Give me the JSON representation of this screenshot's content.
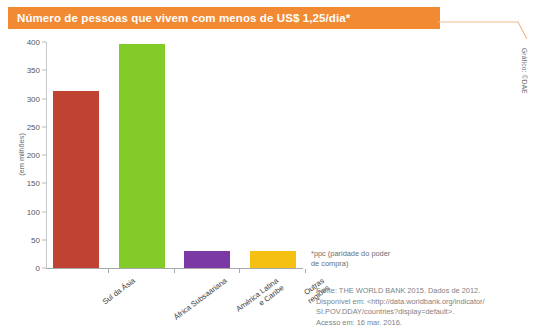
{
  "title": {
    "text": "Número de pessoas que vivem com menos de US$ 1,25/dia*",
    "banner_color": "#f28a34"
  },
  "credit": "Gráfico: ©DAE",
  "footnote": "*ppc (paridade do poder\nde compra)",
  "source": {
    "line1": "Fonte: THE WORLD BANK 2015. Dados de 2012.",
    "line2": "Disponível em: <http://data.worldbank.org/indicator/",
    "line3": "SI.POV.DDAY/countries?display=default>.",
    "line4": "Acesso em: 16 mar. 2016."
  },
  "chart_data": {
    "type": "bar",
    "title": "Número de pessoas que vivem com menos de US$ 1,25/dia*",
    "xlabel": "",
    "ylabel": "(em milhões)",
    "ylim": [
      0,
      400
    ],
    "yticks": [
      0,
      50,
      100,
      150,
      200,
      250,
      300,
      350,
      400
    ],
    "ytick_labels": [
      "0",
      "50",
      "100",
      "150",
      "200",
      "250",
      "300",
      "350",
      "400"
    ],
    "grid": false,
    "legend": false,
    "categories": [
      "Sul da Ásia",
      "África Subsaariana",
      "América Latina\ne Caribe",
      "Outras regiões"
    ],
    "values": [
      313,
      396,
      31,
      31
    ],
    "colors": [
      "#bf4232",
      "#82cb28",
      "#7b3aa3",
      "#f6c013"
    ]
  }
}
